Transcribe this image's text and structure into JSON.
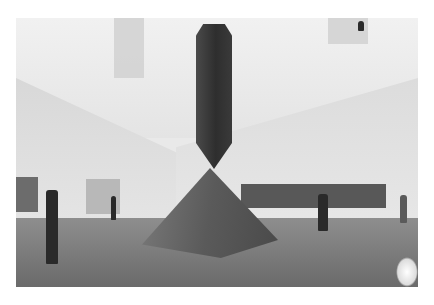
{
  "image": {
    "description": "Black-and-white photograph of a museum atrium with a large obelisk sculpture balanced point-down on a pyramid base, visitors viewing paintings on the walls",
    "subjects": [
      "obelisk-sculpture",
      "pyramid-base",
      "visitors",
      "wall-paintings",
      "skylight"
    ],
    "palette": {
      "background": "#ffffff",
      "wall": "#e6e6e6",
      "floor": "#6e6e6e",
      "sculpture": "#333333"
    }
  }
}
